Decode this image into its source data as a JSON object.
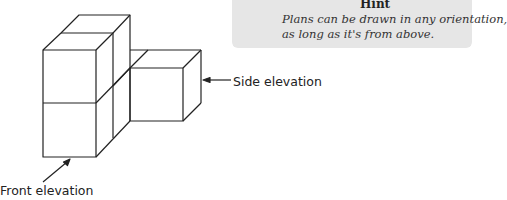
{
  "hint": {
    "title": "Hint",
    "lines": [
      "Plans can be drawn in any orientation,",
      "as long as it's from above."
    ],
    "background_color": "#e6e6e6"
  },
  "labels": {
    "side_elevation": "Side elevation",
    "front_elevation": "Front elevation"
  },
  "diagram": {
    "line_color": "#222222"
  }
}
